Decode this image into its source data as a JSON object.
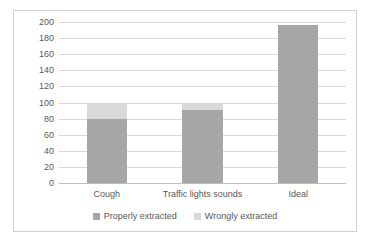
{
  "chart_data": {
    "type": "bar",
    "subtype": "stacked-bar",
    "title": "",
    "subtitle": "",
    "xlabel": "",
    "ylabel": "",
    "categories": [
      "Cough",
      "Traffic lights sounds",
      "Ideal"
    ],
    "series": [
      {
        "name": "Properly extracted",
        "color": "#a6a6a6",
        "values": [
          79,
          91,
          196
        ]
      },
      {
        "name": "Wrongly extracted",
        "color": "#d9d9d9",
        "values": [
          21,
          8,
          0
        ]
      }
    ],
    "ylim": [
      0,
      200
    ],
    "ytick_step": 20,
    "yticks": [
      0,
      20,
      40,
      60,
      80,
      100,
      120,
      140,
      160,
      180,
      200
    ],
    "ytick_labels": [
      "0",
      "20",
      "40",
      "60",
      "80",
      "100",
      "120",
      "140",
      "160",
      "180",
      "200"
    ],
    "grid": "horizontal",
    "legend_position": "bottom",
    "plot_background": "#ffffff",
    "gridline_color": "#d9d9d9",
    "border_color": "#d0d0d0",
    "tick_label_color": "#595959"
  },
  "legend": {
    "items": [
      {
        "label": "Properly extracted",
        "color": "#a6a6a6"
      },
      {
        "label": "Wrongly extracted",
        "color": "#d9d9d9"
      }
    ]
  }
}
